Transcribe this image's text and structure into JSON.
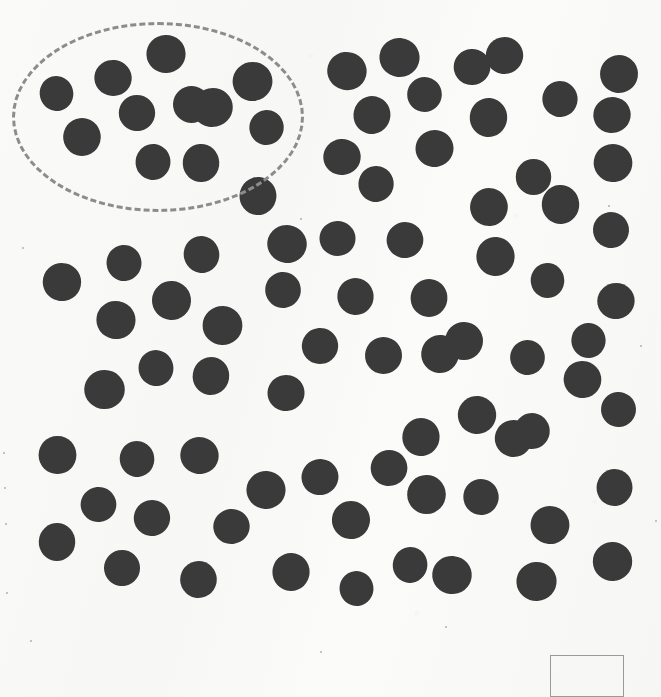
{
  "page": {
    "width": 661,
    "height": 697,
    "background_color": "#f9f9f8"
  },
  "style": {
    "dot_color": "#3a3a3a",
    "ellipse_stroke_color": "#8c8c8c",
    "answer_box_border_color": "#9a9a9a",
    "dot_diameter_px": 37
  },
  "chart_data": {
    "type": "scatter",
    "title": "",
    "xlabel": "",
    "ylabel": "",
    "xlim": [
      0,
      661
    ],
    "ylim": [
      0,
      697
    ],
    "grid": false,
    "legend": "none",
    "marker": "filled-circle",
    "marker_color": "#3a3a3a",
    "marker_diameter_px": 37,
    "total_dots": 84,
    "circled_group_label": "dashed-ellipse-selection",
    "circled_group_count": 11,
    "uncircled_count": 73,
    "annotations": [
      {
        "kind": "ellipse",
        "style": "dashed",
        "color": "#8c8c8c",
        "cx": 158,
        "cy": 117,
        "rx": 146,
        "ry": 95
      },
      {
        "kind": "rect",
        "style": "solid",
        "color": "#9a9a9a",
        "x": 550,
        "y": 655,
        "width": 74,
        "height": 42
      }
    ],
    "points_circled": [
      {
        "x": 57,
        "y": 94
      },
      {
        "x": 113,
        "y": 78
      },
      {
        "x": 166,
        "y": 54
      },
      {
        "x": 252,
        "y": 81
      },
      {
        "x": 137,
        "y": 113
      },
      {
        "x": 191,
        "y": 104
      },
      {
        "x": 82,
        "y": 137
      },
      {
        "x": 267,
        "y": 128
      },
      {
        "x": 153,
        "y": 162
      },
      {
        "x": 201,
        "y": 163
      },
      {
        "x": 212,
        "y": 107
      }
    ],
    "points_outside": [
      {
        "x": 347,
        "y": 71
      },
      {
        "x": 399,
        "y": 57
      },
      {
        "x": 472,
        "y": 67
      },
      {
        "x": 504,
        "y": 55
      },
      {
        "x": 619,
        "y": 74
      },
      {
        "x": 425,
        "y": 95
      },
      {
        "x": 560,
        "y": 99
      },
      {
        "x": 372,
        "y": 115
      },
      {
        "x": 488,
        "y": 117
      },
      {
        "x": 342,
        "y": 157
      },
      {
        "x": 434,
        "y": 148
      },
      {
        "x": 613,
        "y": 163
      },
      {
        "x": 534,
        "y": 177
      },
      {
        "x": 611,
        "y": 230
      },
      {
        "x": 489,
        "y": 207
      },
      {
        "x": 495,
        "y": 256
      },
      {
        "x": 124,
        "y": 263
      },
      {
        "x": 201,
        "y": 254
      },
      {
        "x": 287,
        "y": 244
      },
      {
        "x": 338,
        "y": 239
      },
      {
        "x": 405,
        "y": 240
      },
      {
        "x": 62,
        "y": 282
      },
      {
        "x": 171,
        "y": 300
      },
      {
        "x": 283,
        "y": 290
      },
      {
        "x": 355,
        "y": 296
      },
      {
        "x": 429,
        "y": 298
      },
      {
        "x": 548,
        "y": 281
      },
      {
        "x": 616,
        "y": 301
      },
      {
        "x": 116,
        "y": 320
      },
      {
        "x": 222,
        "y": 325
      },
      {
        "x": 320,
        "y": 346
      },
      {
        "x": 383,
        "y": 355
      },
      {
        "x": 440,
        "y": 354
      },
      {
        "x": 589,
        "y": 341
      },
      {
        "x": 156,
        "y": 368
      },
      {
        "x": 211,
        "y": 376
      },
      {
        "x": 104,
        "y": 389
      },
      {
        "x": 286,
        "y": 393
      },
      {
        "x": 582,
        "y": 379
      },
      {
        "x": 477,
        "y": 415
      },
      {
        "x": 619,
        "y": 410
      },
      {
        "x": 532,
        "y": 431
      },
      {
        "x": 421,
        "y": 437
      },
      {
        "x": 57,
        "y": 455
      },
      {
        "x": 137,
        "y": 459
      },
      {
        "x": 199,
        "y": 455
      },
      {
        "x": 266,
        "y": 490
      },
      {
        "x": 99,
        "y": 505
      },
      {
        "x": 152,
        "y": 518
      },
      {
        "x": 351,
        "y": 520
      },
      {
        "x": 426,
        "y": 494
      },
      {
        "x": 481,
        "y": 497
      },
      {
        "x": 614,
        "y": 487
      },
      {
        "x": 57,
        "y": 542
      },
      {
        "x": 232,
        "y": 527
      },
      {
        "x": 320,
        "y": 477
      },
      {
        "x": 550,
        "y": 525
      },
      {
        "x": 612,
        "y": 561
      },
      {
        "x": 122,
        "y": 568
      },
      {
        "x": 198,
        "y": 579
      },
      {
        "x": 291,
        "y": 572
      },
      {
        "x": 357,
        "y": 589
      },
      {
        "x": 410,
        "y": 565
      },
      {
        "x": 452,
        "y": 575
      },
      {
        "x": 536,
        "y": 581
      },
      {
        "x": 389,
        "y": 468
      },
      {
        "x": 513,
        "y": 438
      },
      {
        "x": 464,
        "y": 341
      },
      {
        "x": 528,
        "y": 358
      },
      {
        "x": 376,
        "y": 184
      },
      {
        "x": 258,
        "y": 196
      },
      {
        "x": 560,
        "y": 204
      },
      {
        "x": 612,
        "y": 115
      }
    ]
  },
  "elements": {
    "group_circle": {
      "name": "dashed group ellipse",
      "interactive": false
    },
    "answer_box": {
      "name": "answer box",
      "value": "",
      "placeholder": ""
    }
  }
}
